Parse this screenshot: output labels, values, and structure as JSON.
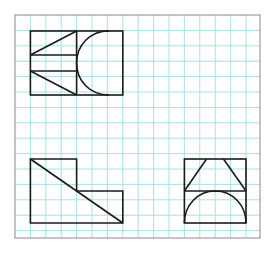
{
  "diagram": {
    "type": "orthographic-projection-exercise",
    "background_color": "#ffffff",
    "grid": {
      "color": "#9fdce8",
      "spacing_px": 15.4,
      "origin": [
        15,
        15
      ],
      "columns": 16,
      "rows": 14
    },
    "frame_color": "#8a8a8a",
    "line_color": "#1a1a1a",
    "views": [
      {
        "name": "top-view",
        "position": "top-left",
        "description": "Rectangle split vertically; left half has two horizontal lines with two diagonals forming wedges; right half has a curved (parabolic/semicircular) profile opening to the right"
      },
      {
        "name": "front-view",
        "position": "bottom-left",
        "description": "L-shaped stepped outline with a diagonal running from top-left corner to bottom-right corner"
      },
      {
        "name": "side-view",
        "position": "bottom-right",
        "description": "Square split horizontally; upper half contains a trapezoid with slanted sides; lower half contains a semicircular arch"
      }
    ]
  }
}
